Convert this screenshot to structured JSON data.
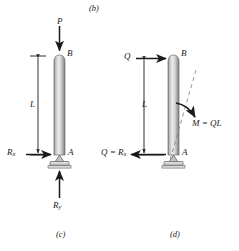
{
  "figure": {
    "top_caption": "(b)",
    "panels": [
      {
        "id": "c",
        "caption": "(c)",
        "member_labels": {
          "top_joint": "B",
          "bottom_joint": "A"
        },
        "dimension": {
          "label": "L"
        },
        "loads": [
          {
            "name": "applied-axial-load",
            "label": "P",
            "direction": "down"
          },
          {
            "name": "horizontal-reaction",
            "label": "R",
            "subscript": "x",
            "direction": "right"
          },
          {
            "name": "vertical-reaction",
            "label": "R",
            "subscript": "y",
            "direction": "up"
          }
        ]
      },
      {
        "id": "d",
        "caption": "(d)",
        "member_labels": {
          "top_joint": "B",
          "bottom_joint": "A"
        },
        "dimension": {
          "label": "L"
        },
        "loads": [
          {
            "name": "applied-lateral-load",
            "label": "Q",
            "direction": "right"
          },
          {
            "name": "base-shear-reaction",
            "label": "Q = R",
            "subscript": "x",
            "direction": "left"
          },
          {
            "name": "moment",
            "label": "M = QL",
            "direction": "clockwise"
          }
        ]
      }
    ],
    "colors": {
      "ink": "#1a1a1a",
      "member_light": "#e8e8e8",
      "member_mid": "#c9c9c9",
      "member_dark": "#8d8d8d",
      "member_edge": "#5a5a5a",
      "support_fill": "#d2d2d2",
      "dash": "#8a8a8a"
    }
  }
}
